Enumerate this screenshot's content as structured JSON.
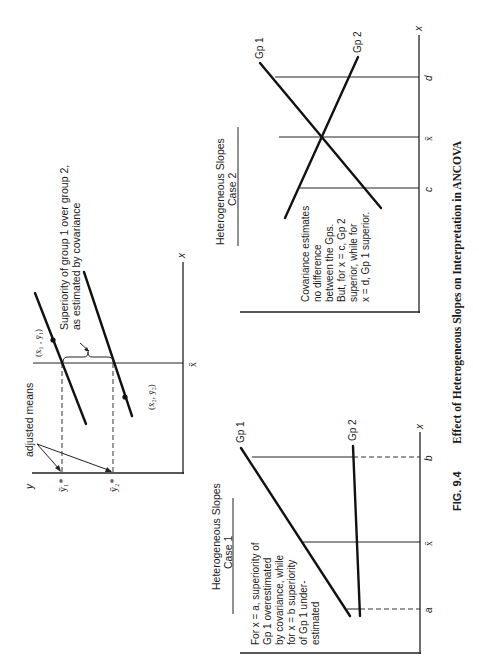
{
  "figure": {
    "number": "FIG. 9.4",
    "caption": "Effect of Heterogeneous Slopes on Interpretation in ANCOVA",
    "orientation": "rotated 90° counterclockwise (landscape on portrait page)"
  },
  "panels": {
    "adjusted_means": {
      "y_axis_label": "y",
      "x_axis_label": "x",
      "xbar_label": "x̄",
      "adjusted_means_label": "adjusted means",
      "y1_adj_label": "ȳ₁*",
      "y2_adj_label": "ȳ₂*",
      "point1_label": "(x̄₁ , ȳ₁)",
      "point2_label": "(x̄₂, ȳ₂)",
      "superiority_label_line1": "Superiority of group 1 over group 2,",
      "superiority_label_line2": "as estimated by covariance"
    },
    "case1": {
      "title_line1": "Heterogeneous Slopes",
      "title_line2": "Case 1",
      "note_lines": [
        "For x  =  a, superiority of",
        "Gp 1 overestimated",
        "by covariance, while",
        "for x  =  b superiority",
        "of Gp 1 under-",
        "estimated"
      ],
      "gp1_label": "Gp 1",
      "gp2_label": "Gp 2",
      "x_axis_label": "x",
      "ticks": [
        "a",
        "x̄",
        "b"
      ]
    },
    "case2": {
      "title_line1": "Heterogeneous Slopes",
      "title_line2": "Case 2",
      "note_lines": [
        "Covariance estimates",
        "no difference",
        "between the Gps.",
        "But, for x  =  c, Gp 2",
        "superior, while for",
        "x  =  d, Gp 1 superior."
      ],
      "gp1_label": "Gp 1",
      "gp2_label": "Gp 2",
      "x_axis_label": "x",
      "ticks": [
        "c",
        "x̄",
        "d"
      ]
    }
  }
}
